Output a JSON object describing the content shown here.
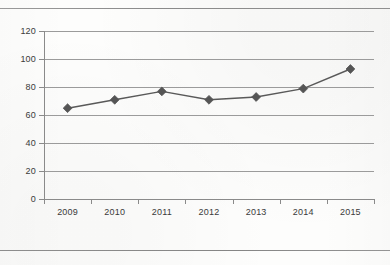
{
  "document": {
    "rule_top": "horizontal-rule",
    "rule_bottom": "horizontal-rule"
  },
  "chart_data": {
    "type": "line",
    "title": "",
    "subtitle": "",
    "xlabel": "",
    "ylabel": "",
    "categories": [
      "2009",
      "2010",
      "2011",
      "2012",
      "2013",
      "2014",
      "2015"
    ],
    "values": [
      72,
      78,
      84,
      78,
      80,
      86,
      100
    ],
    "series": [
      {
        "name": "",
        "values": [
          72,
          78,
          84,
          78,
          80,
          86,
          100
        ]
      }
    ],
    "ylim": [
      0,
      120
    ],
    "yticks": [
      0,
      20,
      40,
      60,
      80,
      100,
      120
    ],
    "ytick_labels": [
      "0",
      "20",
      "40",
      "60",
      "80",
      "100",
      "120"
    ],
    "grid": true,
    "grid_axis": "y",
    "legend": false,
    "legend_position": "none",
    "marker": "diamond",
    "colors": {
      "line": "#595959",
      "marker": "#555555",
      "grid": "#9b9b9b",
      "axis": "#8a8a8a",
      "text": "#3a3a3a",
      "background": "#fdfdfc"
    }
  }
}
